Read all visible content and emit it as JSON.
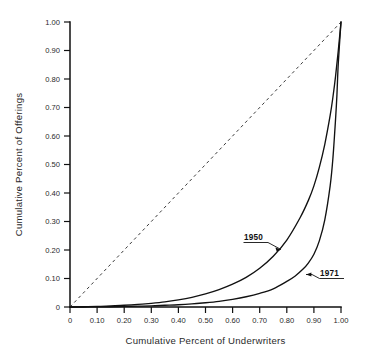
{
  "chart_data": {
    "type": "line",
    "title": "",
    "subtitle": "",
    "xlabel": "Cumulative Percent of Underwriters",
    "ylabel": "Cumulative Percent of Offerings",
    "xlim": [
      0,
      1.0
    ],
    "ylim": [
      0,
      1.0
    ],
    "grid": false,
    "legend_position": "inline-annotation",
    "xticks": [
      "0",
      "0.10",
      "0.20",
      "0.30",
      "0.40",
      "0.50",
      "0.60",
      "0.70",
      "0.80",
      "0.90",
      "1.00"
    ],
    "xtick_values": [
      0,
      0.1,
      0.2,
      0.3,
      0.4,
      0.5,
      0.6,
      0.7,
      0.8,
      0.9,
      1.0
    ],
    "yticks": [
      "0",
      "0.10",
      "0.20",
      "0.30",
      "0.40",
      "0.50",
      "0.60",
      "0.70",
      "0.80",
      "0.90",
      "1.00"
    ],
    "ytick_values": [
      0,
      0.1,
      0.2,
      0.3,
      0.4,
      0.5,
      0.6,
      0.7,
      0.8,
      0.9,
      1.0
    ],
    "series": [
      {
        "name": "equality-line",
        "label": "",
        "style": "dashed",
        "x": [
          0,
          1.0
        ],
        "values": [
          0,
          1.0
        ]
      },
      {
        "name": "1950",
        "label": "1950",
        "style": "solid",
        "x": [
          0.0,
          0.05,
          0.1,
          0.15,
          0.2,
          0.25,
          0.3,
          0.35,
          0.4,
          0.45,
          0.5,
          0.55,
          0.6,
          0.65,
          0.7,
          0.75,
          0.8,
          0.85,
          0.88,
          0.9,
          0.92,
          0.94,
          0.96,
          0.97,
          0.98,
          0.99,
          1.0
        ],
        "values": [
          0.0,
          0.001,
          0.002,
          0.004,
          0.006,
          0.009,
          0.013,
          0.018,
          0.025,
          0.034,
          0.046,
          0.061,
          0.08,
          0.104,
          0.136,
          0.178,
          0.235,
          0.315,
          0.375,
          0.425,
          0.49,
          0.57,
          0.672,
          0.735,
          0.81,
          0.9,
          1.0
        ]
      },
      {
        "name": "1971",
        "label": "1971",
        "style": "solid",
        "x": [
          0.0,
          0.05,
          0.1,
          0.15,
          0.2,
          0.25,
          0.3,
          0.35,
          0.4,
          0.45,
          0.5,
          0.55,
          0.6,
          0.65,
          0.7,
          0.75,
          0.8,
          0.83,
          0.86,
          0.88,
          0.9,
          0.92,
          0.94,
          0.96,
          0.97,
          0.98,
          0.985,
          0.99,
          1.0
        ],
        "values": [
          0.0,
          0.0,
          0.001,
          0.001,
          0.002,
          0.003,
          0.004,
          0.006,
          0.008,
          0.011,
          0.015,
          0.02,
          0.027,
          0.036,
          0.048,
          0.064,
          0.09,
          0.108,
          0.133,
          0.155,
          0.185,
          0.232,
          0.305,
          0.425,
          0.52,
          0.66,
          0.745,
          0.855,
          1.0
        ]
      }
    ],
    "annotations": [
      {
        "name": "annotation-1950",
        "text": "1950",
        "underlined": true,
        "points_to": [
          0.75,
          0.155
        ]
      },
      {
        "name": "annotation-1971",
        "text": "1971",
        "underlined": true,
        "points_to": [
          0.905,
          0.105
        ]
      }
    ]
  },
  "colors": {
    "ink": "#111111",
    "axis": "#111111",
    "background": "#ffffff",
    "dash": "#3a3a3a"
  }
}
